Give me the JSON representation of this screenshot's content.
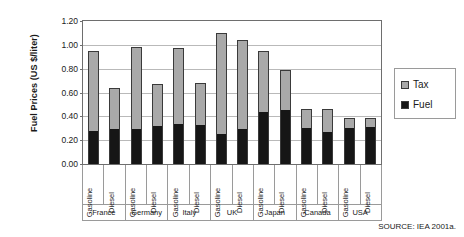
{
  "chart_data": {
    "type": "bar",
    "stacked": true,
    "title": "",
    "xlabel": "",
    "ylabel": "Fuel Prices (US $/liter)",
    "ylim": [
      0.0,
      1.2
    ],
    "yticks": [
      "0.00",
      "0.20",
      "0.40",
      "0.60",
      "0.80",
      "1.00",
      "1.20"
    ],
    "ytick_values": [
      0.0,
      0.2,
      0.4,
      0.6,
      0.8,
      1.0,
      1.2
    ],
    "grid": true,
    "legend_position": "right",
    "legend": [
      {
        "name": "Tax",
        "color": "#a9a9a9"
      },
      {
        "name": "Fuel",
        "color": "#161616"
      }
    ],
    "groups": [
      "France",
      "Germany",
      "Italy",
      "UK",
      "Japan",
      "Canada",
      "USA"
    ],
    "categories": [
      "Gasoline",
      "Diesel",
      "Gasoline",
      "Diesel",
      "Gasoline",
      "Diesel",
      "Gasoline",
      "Diesel",
      "Gasoline",
      "Diesel",
      "Gasoline",
      "Diesel",
      "Gasoline",
      "Diesel"
    ],
    "series": [
      {
        "name": "Fuel",
        "values": [
          0.28,
          0.3,
          0.3,
          0.32,
          0.34,
          0.33,
          0.25,
          0.3,
          0.44,
          0.46,
          0.31,
          0.27,
          0.31,
          0.32
        ]
      },
      {
        "name": "Tax",
        "values": [
          0.67,
          0.34,
          0.68,
          0.35,
          0.635,
          0.35,
          0.85,
          0.74,
          0.51,
          0.33,
          0.15,
          0.19,
          0.08,
          0.07
        ]
      }
    ],
    "totals": [
      0.95,
      0.64,
      0.98,
      0.67,
      0.975,
      0.68,
      1.1,
      1.04,
      0.95,
      0.79,
      0.46,
      0.46,
      0.39,
      0.39
    ],
    "bars": [
      {
        "group": "France",
        "category": "Gasoline",
        "fuel": 0.28,
        "tax": 0.67,
        "total": 0.95
      },
      {
        "group": "France",
        "category": "Diesel",
        "fuel": 0.3,
        "tax": 0.34,
        "total": 0.64
      },
      {
        "group": "Germany",
        "category": "Gasoline",
        "fuel": 0.3,
        "tax": 0.68,
        "total": 0.98
      },
      {
        "group": "Germany",
        "category": "Diesel",
        "fuel": 0.32,
        "tax": 0.35,
        "total": 0.67
      },
      {
        "group": "Italy",
        "category": "Gasoline",
        "fuel": 0.34,
        "tax": 0.635,
        "total": 0.975
      },
      {
        "group": "Italy",
        "category": "Diesel",
        "fuel": 0.33,
        "tax": 0.35,
        "total": 0.68
      },
      {
        "group": "UK",
        "category": "Gasoline",
        "fuel": 0.25,
        "tax": 0.85,
        "total": 1.1
      },
      {
        "group": "UK",
        "category": "Diesel",
        "fuel": 0.3,
        "tax": 0.74,
        "total": 1.04
      },
      {
        "group": "Japan",
        "category": "Gasoline",
        "fuel": 0.44,
        "tax": 0.51,
        "total": 0.95
      },
      {
        "group": "Japan",
        "category": "Diesel",
        "fuel": 0.46,
        "tax": 0.33,
        "total": 0.79
      },
      {
        "group": "Canada",
        "category": "Gasoline",
        "fuel": 0.31,
        "tax": 0.15,
        "total": 0.46
      },
      {
        "group": "Canada",
        "category": "Diesel",
        "fuel": 0.27,
        "tax": 0.19,
        "total": 0.46
      },
      {
        "group": "USA",
        "category": "Gasoline",
        "fuel": 0.31,
        "tax": 0.08,
        "total": 0.39
      },
      {
        "group": "USA",
        "category": "Diesel",
        "fuel": 0.32,
        "tax": 0.07,
        "total": 0.39
      }
    ]
  },
  "source_note": "SOURCE: IEA 2001a."
}
